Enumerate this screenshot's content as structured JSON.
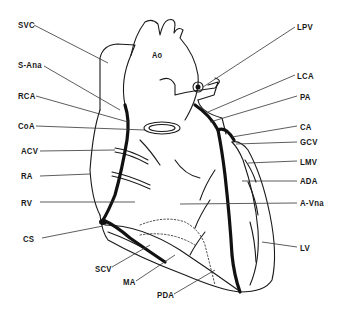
{
  "figure": {
    "labels_left": [
      {
        "id": "svc",
        "text": "SVC",
        "x": 18,
        "y": 20
      },
      {
        "id": "s-ana",
        "text": "S-Ana",
        "x": 18,
        "y": 60
      },
      {
        "id": "rca",
        "text": "RCA",
        "x": 18,
        "y": 91
      },
      {
        "id": "coa",
        "text": "CoA",
        "x": 18,
        "y": 121
      },
      {
        "id": "acv",
        "text": "ACV",
        "x": 21,
        "y": 146
      },
      {
        "id": "ra",
        "text": "RA",
        "x": 21,
        "y": 171
      },
      {
        "id": "rv",
        "text": "RV",
        "x": 21,
        "y": 198
      },
      {
        "id": "cs",
        "text": "CS",
        "x": 23,
        "y": 234
      }
    ],
    "labels_right": [
      {
        "id": "lpv",
        "text": "LPV",
        "x": 297,
        "y": 22
      },
      {
        "id": "lca",
        "text": "LCA",
        "x": 297,
        "y": 71
      },
      {
        "id": "pa",
        "text": "PA",
        "x": 300,
        "y": 92
      },
      {
        "id": "ca",
        "text": "CA",
        "x": 300,
        "y": 122
      },
      {
        "id": "gcv",
        "text": "GCV",
        "x": 300,
        "y": 137
      },
      {
        "id": "lmv",
        "text": "LMV",
        "x": 300,
        "y": 157
      },
      {
        "id": "ada",
        "text": "ADA",
        "x": 300,
        "y": 176
      },
      {
        "id": "a-vna",
        "text": "A-Vna",
        "x": 300,
        "y": 198
      },
      {
        "id": "lv",
        "text": "LV",
        "x": 300,
        "y": 243
      }
    ],
    "labels_bottom": [
      {
        "id": "scv",
        "text": "SCV",
        "x": 95,
        "y": 264
      },
      {
        "id": "ma",
        "text": "MA",
        "x": 123,
        "y": 277
      },
      {
        "id": "pda",
        "text": "PDA",
        "x": 157,
        "y": 290
      }
    ],
    "label_inner": {
      "id": "ao",
      "text": "Ao",
      "x": 152,
      "y": 50
    },
    "colors": {
      "ink": "#1a1a1a",
      "background": "#ffffff"
    }
  }
}
